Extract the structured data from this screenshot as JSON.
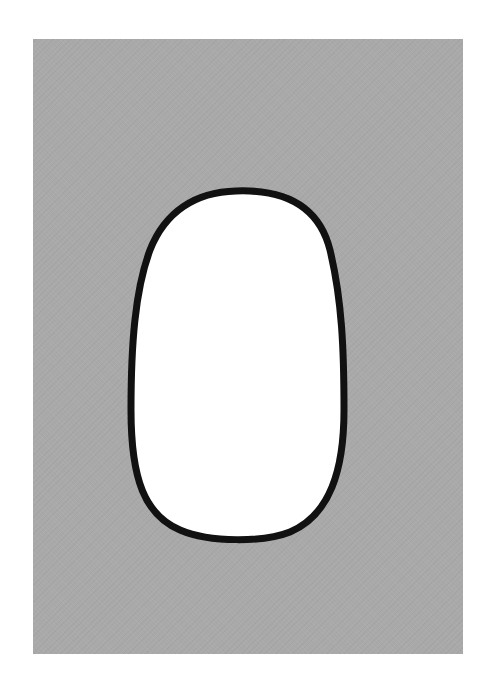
{
  "scene": {
    "background_color": "#ffffff",
    "panel": {
      "color": "#a9a9a9"
    },
    "shape": {
      "type": "egg-oval",
      "fill": "#ffffff",
      "stroke": "#111111",
      "stroke_width": 7
    }
  }
}
